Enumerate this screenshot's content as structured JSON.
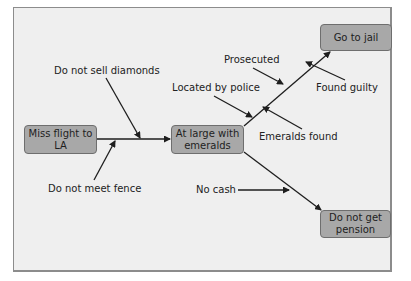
{
  "diagram": {
    "type": "cause-and-effect",
    "nodes": [
      {
        "id": "miss_flight",
        "label": "Miss flight to LA",
        "line1": "Miss flight to",
        "line2": "LA"
      },
      {
        "id": "at_large",
        "label": "At large with emeralds",
        "line1": "At large with",
        "line2": "emeralds"
      },
      {
        "id": "go_to_jail",
        "label": "Go to jail"
      },
      {
        "id": "no_pension",
        "label": "Do not get pension",
        "line1": "Do not get",
        "line2": "pension"
      }
    ],
    "causes": [
      {
        "label": "Do not sell diamonds",
        "target_edge": "miss_flight->at_large"
      },
      {
        "label": "Do not meet fence",
        "target_edge": "miss_flight->at_large"
      },
      {
        "label": "Located by police",
        "target_edge": "at_large->go_to_jail"
      },
      {
        "label": "Prosecuted",
        "target_edge": "at_large->go_to_jail"
      },
      {
        "label": "Emeralds found",
        "target_edge": "at_large->go_to_jail"
      },
      {
        "label": "Found guilty",
        "target_edge": "at_large->go_to_jail"
      },
      {
        "label": "No cash",
        "target_edge": "at_large->no_pension"
      }
    ],
    "edges": [
      {
        "from": "miss_flight",
        "to": "at_large"
      },
      {
        "from": "at_large",
        "to": "go_to_jail"
      },
      {
        "from": "at_large",
        "to": "no_pension"
      }
    ],
    "colors": {
      "node_fill": "#a8a8a8",
      "node_border": "#6e6e6e",
      "background": "#efefef",
      "line": "#1e1e1e"
    }
  }
}
